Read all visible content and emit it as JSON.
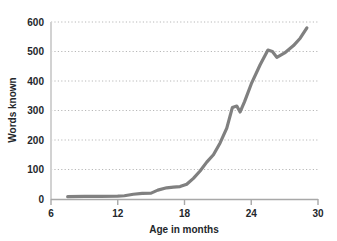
{
  "chart_data": {
    "type": "line",
    "title": "",
    "subtitle": "",
    "xlabel": "Age in months",
    "ylabel": "Words known",
    "xlim": [
      6,
      30
    ],
    "ylim": [
      0,
      600
    ],
    "xticks": [
      6,
      12,
      18,
      24,
      30
    ],
    "yticks": [
      0,
      100,
      200,
      300,
      400,
      500,
      600
    ],
    "xtick_labels": [
      "6",
      "12",
      "18",
      "24",
      "30"
    ],
    "ytick_labels": [
      "0",
      "100",
      "200",
      "300",
      "400",
      "500",
      "600"
    ],
    "grid": "horizontal-dotted",
    "legend": "none",
    "line_color": "#808080",
    "axis_color": "#aeaeae",
    "grid_color": "#b8b8b8",
    "text_color": "#23272b",
    "series": [
      {
        "name": "Words known",
        "x": [
          7.5,
          9.0,
          10.5,
          12.0,
          12.6,
          13.4,
          14.2,
          15.0,
          15.6,
          16.4,
          17.0,
          17.6,
          18.2,
          18.8,
          19.4,
          20.0,
          20.6,
          21.2,
          21.8,
          22.3,
          22.7,
          23.0,
          23.4,
          24.0,
          24.8,
          25.5,
          25.9,
          26.3,
          27.0,
          27.8,
          28.4,
          29.0
        ],
        "y": [
          8,
          9,
          9,
          10,
          11,
          16,
          19,
          20,
          30,
          38,
          40,
          42,
          50,
          70,
          95,
          125,
          150,
          190,
          240,
          310,
          315,
          295,
          330,
          390,
          455,
          505,
          500,
          480,
          495,
          520,
          545,
          580
        ]
      }
    ]
  },
  "axis": {
    "x_title": "Age in months",
    "y_title": "Words known"
  }
}
